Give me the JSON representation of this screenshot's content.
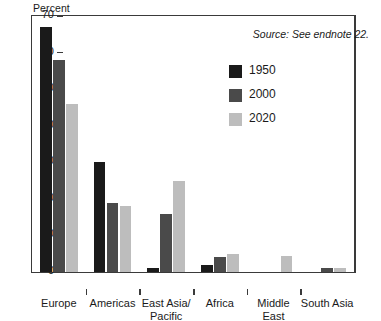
{
  "chart_data": {
    "type": "bar",
    "title": "",
    "subtitle": "",
    "xlabel": "",
    "ylabel": "Percent",
    "ylim": [
      0,
      70
    ],
    "yticks": [
      0,
      10,
      20,
      30,
      40,
      50,
      60,
      70
    ],
    "ytick_labels": [
      "0",
      "10",
      "20",
      "30",
      "40",
      "50",
      "60",
      "70"
    ],
    "grid": false,
    "legend_position": "top-right inside",
    "categories": [
      "Europe",
      "Americas",
      "East Asia/ Pacific",
      "Africa",
      "Middle East",
      "South Asia"
    ],
    "category_lines": [
      [
        "Europe"
      ],
      [
        "Americas"
      ],
      [
        "East Asia/",
        "Pacific"
      ],
      [
        "Africa"
      ],
      [
        "Middle",
        "East"
      ],
      [
        "South Asia"
      ]
    ],
    "series": [
      {
        "name": "1950",
        "color": "#1a1a1a",
        "values": [
          67,
          30,
          1,
          2,
          0,
          0
        ]
      },
      {
        "name": "2000",
        "color": "#4a4a4a",
        "values": [
          58,
          19,
          16,
          4,
          0,
          1
        ]
      },
      {
        "name": "2020",
        "color": "#bdbdbd",
        "values": [
          46,
          18,
          25,
          5,
          4.5,
          1
        ]
      }
    ],
    "annotations": [
      {
        "name": "source-note",
        "text": "Source: See endnote 22."
      }
    ]
  },
  "legend": {
    "items": [
      {
        "label": "1950",
        "color": "#1a1a1a"
      },
      {
        "label": "2000",
        "color": "#4a4a4a"
      },
      {
        "label": "2020",
        "color": "#bdbdbd"
      }
    ]
  },
  "source": {
    "text": "Source: See endnote 22."
  },
  "axis": {
    "y_title": "Percent"
  },
  "colors": {
    "axis": "#3a3a3a",
    "background": "#ffffff",
    "text": "#1a1a1a"
  }
}
